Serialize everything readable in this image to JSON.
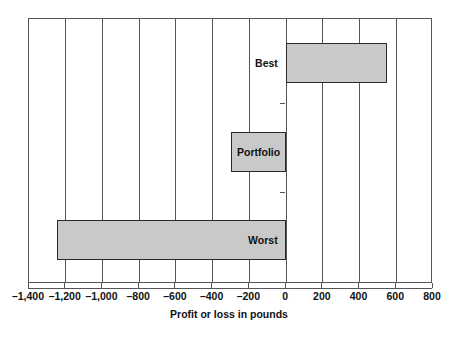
{
  "chart_data": {
    "type": "bar",
    "orientation": "horizontal",
    "title": "",
    "subtitle": "",
    "xlabel": "Profit or loss in pounds",
    "ylabel": "",
    "categories": [
      "Best",
      "Portfolio",
      "Worst"
    ],
    "values": [
      550,
      -300,
      -1250
    ],
    "series": [
      {
        "name": "Profit or loss",
        "values": [
          550,
          -300,
          -1250
        ]
      }
    ],
    "xlim": [
      -1400,
      800
    ],
    "xticks": [
      -1400,
      -1200,
      -1000,
      -800,
      -600,
      -400,
      -200,
      0,
      200,
      400,
      600,
      800
    ],
    "xticklabels": [
      "–1,400",
      "–1,200",
      "–1,000",
      "–800",
      "–600",
      "–400",
      "–200",
      "0",
      "200",
      "400",
      "600",
      "800"
    ],
    "grid": true,
    "grid_axis": "x",
    "legend": false,
    "legend_position": "none",
    "bar_fill_color": "#c9c9c9",
    "bar_edge_color": "#2b2b2b",
    "grid_color": "#555555",
    "axis_color": "#555555",
    "background_color": "#ffffff",
    "annotations": [
      {
        "text": "Best",
        "category": "Best",
        "placement": "outside-left-of-bar"
      },
      {
        "text": "Portfolio",
        "category": "Portfolio",
        "placement": "inside-bar"
      },
      {
        "text": "Worst",
        "category": "Worst",
        "placement": "inside-bar-right"
      }
    ]
  }
}
